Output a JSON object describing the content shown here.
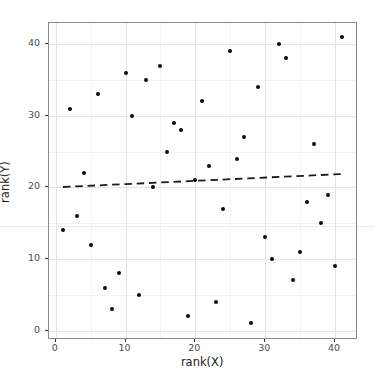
{
  "figure": {
    "background": "#ffffff",
    "artifact_line_color": "#ededed"
  },
  "chart_data": {
    "type": "scatter",
    "title": "",
    "xlabel": "rank(X)",
    "ylabel": "rank(Y)",
    "xlim": [
      -1,
      43
    ],
    "ylim": [
      -1,
      43
    ],
    "x_major_ticks": [
      0,
      10,
      20,
      30,
      40
    ],
    "y_major_ticks": [
      0,
      10,
      20,
      30,
      40
    ],
    "x_minor_ticks": [
      5,
      15,
      25,
      35
    ],
    "y_minor_ticks": [
      5,
      15,
      25,
      35
    ],
    "grid": "on",
    "legend": "none",
    "points": [
      [
        1,
        14
      ],
      [
        2,
        31
      ],
      [
        3,
        16
      ],
      [
        4,
        22
      ],
      [
        5,
        12
      ],
      [
        6,
        33
      ],
      [
        7,
        6
      ],
      [
        8,
        3
      ],
      [
        9,
        8
      ],
      [
        10,
        36
      ],
      [
        11,
        30
      ],
      [
        12,
        5
      ],
      [
        13,
        35
      ],
      [
        14,
        20
      ],
      [
        15,
        37
      ],
      [
        16,
        25
      ],
      [
        17,
        29
      ],
      [
        18,
        28
      ],
      [
        19,
        2
      ],
      [
        20,
        21
      ],
      [
        21,
        32
      ],
      [
        22,
        23
      ],
      [
        23,
        4
      ],
      [
        24,
        17
      ],
      [
        25,
        39
      ],
      [
        26,
        24
      ],
      [
        27,
        27
      ],
      [
        28,
        1
      ],
      [
        29,
        34
      ],
      [
        30,
        13
      ],
      [
        31,
        10
      ],
      [
        32,
        40
      ],
      [
        33,
        38
      ],
      [
        34,
        7
      ],
      [
        35,
        11
      ],
      [
        36,
        18
      ],
      [
        37,
        26
      ],
      [
        38,
        15
      ],
      [
        39,
        19
      ],
      [
        40,
        9
      ],
      [
        41,
        41
      ]
    ],
    "trend_line": {
      "style": "dashed",
      "x_start": 1,
      "y_start": 20.09,
      "x_end": 41,
      "y_end": 21.91,
      "slope": 0.0455,
      "intercept": 20.04
    }
  },
  "colors": {
    "point": "#0b0b0b",
    "trend": "#1c1c1c",
    "grid_major": "#e3e3e3",
    "grid_minor": "#f2f2f2",
    "panel_border": "#8a8a8a",
    "tick_mark": "#333333",
    "tick_label": "#4d4d4d",
    "axis_title": "#1c1c1c"
  }
}
